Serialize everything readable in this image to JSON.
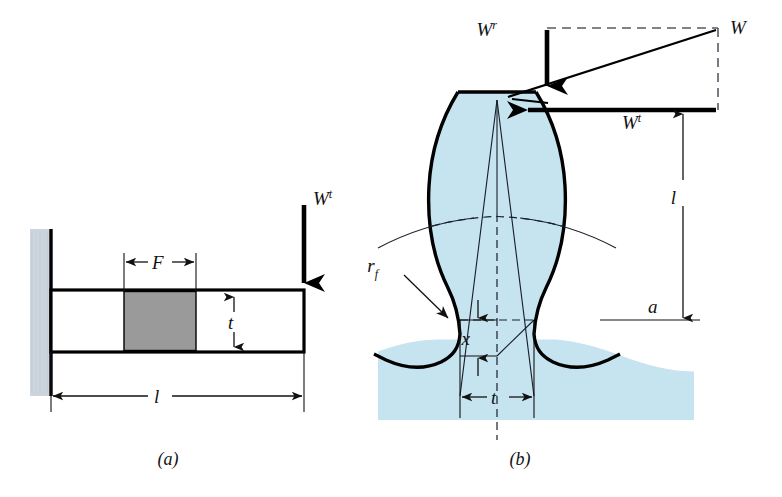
{
  "figure": {
    "background_color": "#ffffff",
    "panels": [
      {
        "id": "a",
        "caption": "(a)",
        "description": "Cantilever beam of rectangular cross section fixed at a wall",
        "labels": {
          "load": "W",
          "load_superscript": "t",
          "face_width": "F",
          "thickness": "t",
          "length": "l"
        },
        "colors": {
          "wall_fill": "#ccd5de",
          "block_fill": "#9a9a9a",
          "outline": "#000000"
        }
      },
      {
        "id": "b",
        "caption": "(b)",
        "description": "Gear tooth with inscribed parabola, load resolved into tangential and radial components",
        "labels": {
          "resultant_load": "W",
          "radial_load": "W",
          "radial_superscript": "r",
          "tangential_load": "W",
          "tangential_superscript": "t",
          "moment_arm": "l",
          "tooth_thickness": "t",
          "parabola_offset": "x",
          "addendum": "a",
          "fillet_radius": "r",
          "fillet_subscript": "f"
        },
        "colors": {
          "tooth_fill": "#c5e4f0",
          "tooth_outline": "#000000",
          "construction_line": "#1a1f2b",
          "dashed_line": "#555b66"
        }
      }
    ]
  }
}
